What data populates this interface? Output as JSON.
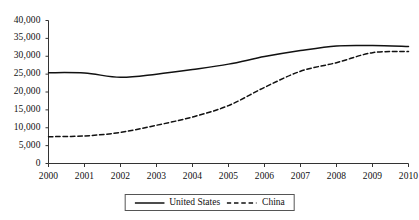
{
  "chart_data": {
    "type": "line",
    "title": "",
    "subtitle": "",
    "xlabel": "",
    "ylabel": "",
    "x": [
      2000,
      2001,
      2002,
      2003,
      2004,
      2005,
      2006,
      2007,
      2008,
      2009,
      2010
    ],
    "categories": [
      "2000",
      "2001",
      "2002",
      "2003",
      "2004",
      "2005",
      "2006",
      "2007",
      "2008",
      "2009",
      "2010"
    ],
    "xlim": [
      2000,
      2010
    ],
    "ylim": [
      0,
      40000
    ],
    "ytick_values": [
      0,
      5000,
      10000,
      15000,
      20000,
      25000,
      30000,
      35000,
      40000
    ],
    "ytick_labels": [
      "0",
      "5,000",
      "10,000",
      "15,000",
      "20,000",
      "25,000",
      "30,000",
      "35,000",
      "40,000"
    ],
    "grid": false,
    "legend_position": "bottom-center",
    "series": [
      {
        "name": "United States",
        "style": "solid",
        "color": "#111111",
        "values": [
          25400,
          25300,
          24100,
          25000,
          26300,
          27800,
          29900,
          31600,
          32900,
          33000,
          32700
        ]
      },
      {
        "name": "China",
        "style": "dashed",
        "color": "#111111",
        "values": [
          7500,
          7700,
          8700,
          10700,
          13000,
          16200,
          21300,
          25800,
          28200,
          31000,
          31300
        ]
      }
    ]
  },
  "legend": {
    "entries": [
      {
        "label": "United States",
        "swatch": "solid-line-icon"
      },
      {
        "label": "China",
        "swatch": "dashed-line-icon"
      }
    ]
  }
}
